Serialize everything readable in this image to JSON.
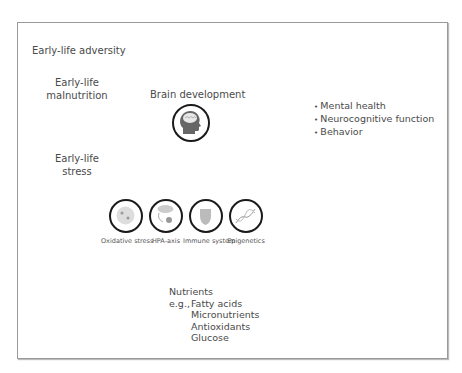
{
  "title": "Early-life adversity",
  "inputs": [
    {
      "label": "Early-life\nmalnutrition",
      "line1": "Early-life",
      "line2": "malnutrition"
    },
    {
      "label": "Early-life\nstress",
      "line1": "Early-life",
      "line2": "stress"
    }
  ],
  "center": {
    "label": "Brain development",
    "icon": "head-brain-icon"
  },
  "outcomes": [
    "Mental health",
    "Neurocognitive function",
    "Behavior"
  ],
  "mechanisms": [
    {
      "label": "Oxidative stress",
      "icon": "cell-icon"
    },
    {
      "label": "HPA-axis",
      "icon": "hpa-axis-icon"
    },
    {
      "label": "Immune system",
      "icon": "shield-icon"
    },
    {
      "label": "Epigenetics",
      "icon": "dna-icon"
    }
  ],
  "nutrients": {
    "heading": "Nutrients",
    "prefix": "e.g.,",
    "items": [
      "Fatty acids",
      "Micronutrients",
      "Antioxidants",
      "Glucose"
    ]
  }
}
